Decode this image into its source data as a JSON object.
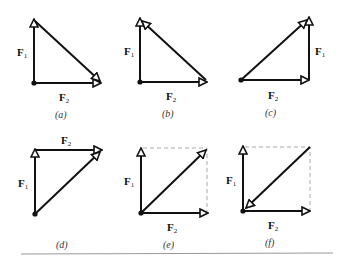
{
  "figure": {
    "panels": [
      {
        "id": "a",
        "caption": "(a)",
        "f1_label": "F",
        "f1_sub": "1",
        "f2_label": "F",
        "f2_sub": "2",
        "description": "F1 up, F2 right from same origin; closing side arrow points to F2 tip"
      },
      {
        "id": "b",
        "caption": "(b)",
        "f1_label": "F",
        "f1_sub": "1",
        "f2_label": "F",
        "f2_sub": "2",
        "description": "F1 up, F2 right from same origin; closing side arrow points to F1 tip"
      },
      {
        "id": "c",
        "caption": "(c)",
        "f1_label": "F",
        "f1_sub": "1",
        "f2_label": "F",
        "f2_sub": "2",
        "description": "F2 right then F1 up (tip-to-tail); resultant from origin to F1 tip"
      },
      {
        "id": "d",
        "caption": "(d)",
        "f1_label": "F",
        "f1_sub": "1",
        "f2_label": "F",
        "f2_sub": "2",
        "description": "F1 up then F2 right (tip-to-tail); resultant from origin to F2 tip"
      },
      {
        "id": "e",
        "caption": "(e)",
        "f1_label": "F",
        "f1_sub": "1",
        "f2_label": "F",
        "f2_sub": "2",
        "description": "Parallelogram: F1 up, F2 right, dashed completion, resultant from origin outward"
      },
      {
        "id": "f",
        "caption": "(f)",
        "f1_label": "F",
        "f1_sub": "1",
        "f2_label": "F",
        "f2_sub": "2",
        "description": "Parallelogram: F1 up, F2 right, dashed completion, diagonal pointing back to origin"
      }
    ],
    "colors": {
      "stroke": "#111111",
      "dashed": "#aaaaaa",
      "rule": "#999999"
    }
  }
}
